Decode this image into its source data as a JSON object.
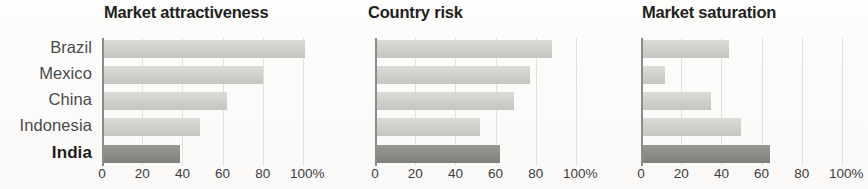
{
  "chart_data": {
    "type": "bar",
    "orientation": "horizontal",
    "categories": [
      "Brazil",
      "Mexico",
      "China",
      "Indonesia",
      "India"
    ],
    "highlight_category": "India",
    "xlabel": "",
    "ylabel": "",
    "xlim": [
      0,
      100
    ],
    "xticks": [
      0,
      20,
      40,
      60,
      80,
      100
    ],
    "xticklabels": [
      "0",
      "20",
      "40",
      "60",
      "80",
      "100%"
    ],
    "grid": true,
    "grid_axis": "x",
    "legend": false,
    "colors": {
      "bar": "#cfcfcb",
      "bar_highlight": "#8a8a86",
      "axis": "#8c8c8c",
      "gridline": "#e2e0dd",
      "title": "#231f20",
      "label": "#4a4a4a",
      "background": "#ffffff"
    },
    "panels": [
      {
        "title": "Market attractiveness",
        "values": [
          100,
          79,
          61,
          48,
          38
        ]
      },
      {
        "title": "Country risk",
        "values": [
          87,
          76,
          68,
          51,
          61
        ]
      },
      {
        "title": "Market saturation",
        "values": [
          43,
          11,
          34,
          49,
          63
        ]
      }
    ]
  }
}
